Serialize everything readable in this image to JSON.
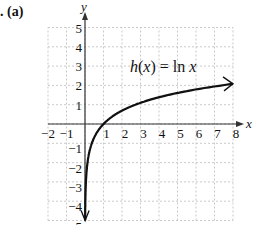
{
  "problem_label": ". (a)",
  "chart_data": {
    "type": "line",
    "title": "",
    "annotation": "h(x) = ln x",
    "function": "ln x",
    "xlabel": "x",
    "ylabel": "y",
    "xlim": [
      -2,
      8
    ],
    "ylim": [
      -5,
      5
    ],
    "x_ticks": [
      -2,
      -1,
      1,
      2,
      3,
      4,
      5,
      6,
      7,
      8
    ],
    "y_ticks": [
      -5,
      -4,
      -3,
      -2,
      -1,
      1,
      2,
      3,
      4,
      5
    ],
    "grid": true,
    "series": [
      {
        "name": "h(x) = ln x",
        "x": [
          0.007,
          0.02,
          0.05,
          0.1,
          0.2,
          0.37,
          0.5,
          1,
          2,
          3,
          4,
          5,
          6,
          7,
          8
        ],
        "values": [
          -5,
          -3.9,
          -3.0,
          -2.3,
          -1.61,
          -1.0,
          -0.69,
          0,
          0.69,
          1.1,
          1.39,
          1.61,
          1.79,
          1.95,
          2.08
        ]
      }
    ],
    "arrows": [
      "down toward -∞ near x=0",
      "right at x=8"
    ]
  },
  "axis_labels": {
    "x": "x",
    "y": "y",
    "x_ticks": [
      "−2",
      "−1",
      "1",
      "2",
      "3",
      "4",
      "5",
      "6",
      "7",
      "8"
    ],
    "y_ticks": [
      "5",
      "4",
      "3",
      "2",
      "1",
      "−1",
      "−2",
      "−3",
      "−4",
      "−5"
    ]
  },
  "annotation": {
    "func": "h",
    "var": "x",
    "rest": " = ln "
  }
}
